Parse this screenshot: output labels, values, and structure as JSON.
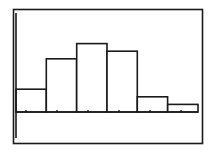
{
  "colors": {
    "background": "#ffffff",
    "ink": "#1a1a1a"
  },
  "chart_data": {
    "type": "bar",
    "subtype": "histogram",
    "title": "",
    "xlabel": "",
    "ylabel": "",
    "categories": [
      "bin1",
      "bin2",
      "bin3",
      "bin4",
      "bin5",
      "bin6"
    ],
    "values": [
      3,
      7,
      9,
      8,
      2,
      1
    ],
    "ylim": [
      -4,
      12
    ],
    "grid": false,
    "legend": null,
    "tick_marks": 6,
    "tick_labels": []
  }
}
